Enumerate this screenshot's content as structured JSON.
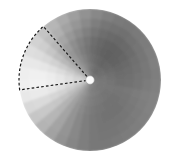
{
  "figure": {
    "name": "polar-grayscale-disk",
    "background_color": "#ffffff",
    "width": 175,
    "height": 164
  },
  "chart_data": {
    "type": "heatmap",
    "subtype": "polar-sector-heatmap",
    "title": "",
    "subtitle": "",
    "xlabel": "",
    "ylabel": "",
    "grid": false,
    "legend": null,
    "colormap": "grayscale",
    "colormap_range": [
      "#6b6b6b",
      "#f2f2f2"
    ],
    "center": {
      "cx": 90,
      "cy": 80,
      "label": "origin-marker"
    },
    "radius": 71,
    "inner_radius": 0,
    "n_angular_bins": 36,
    "n_radial_bins": 8,
    "angle_start_deg": 0,
    "angle_step_deg": 10,
    "radial_edges": [
      0,
      8.875,
      17.75,
      26.625,
      35.5,
      44.375,
      53.25,
      62.125,
      71
    ],
    "value_range": [
      64,
      245
    ],
    "note": "values are 0-255 gray levels per (angular bin, radial bin) cell, angular bin 0 starts at 0deg measured counterclockwise from east",
    "values": [
      [
        120,
        118,
        114,
        110,
        112,
        116,
        120,
        126
      ],
      [
        118,
        116,
        112,
        108,
        110,
        114,
        120,
        128
      ],
      [
        116,
        112,
        108,
        104,
        106,
        112,
        118,
        126
      ],
      [
        114,
        110,
        104,
        100,
        102,
        108,
        116,
        124
      ],
      [
        112,
        108,
        102,
        98,
        100,
        106,
        114,
        122
      ],
      [
        110,
        106,
        100,
        96,
        98,
        104,
        112,
        120
      ],
      [
        112,
        108,
        102,
        98,
        100,
        106,
        114,
        122
      ],
      [
        116,
        112,
        106,
        102,
        104,
        110,
        118,
        128
      ],
      [
        122,
        118,
        112,
        108,
        110,
        118,
        126,
        136
      ],
      [
        130,
        126,
        120,
        116,
        120,
        128,
        138,
        146
      ],
      [
        138,
        134,
        130,
        126,
        130,
        140,
        150,
        158
      ],
      [
        146,
        144,
        140,
        138,
        142,
        152,
        162,
        170
      ],
      [
        156,
        154,
        152,
        150,
        156,
        166,
        176,
        182
      ],
      [
        166,
        166,
        166,
        166,
        172,
        182,
        190,
        196
      ],
      [
        176,
        178,
        180,
        184,
        190,
        198,
        206,
        210
      ],
      [
        186,
        192,
        198,
        204,
        210,
        216,
        220,
        222
      ],
      [
        196,
        204,
        212,
        220,
        226,
        230,
        232,
        232
      ],
      [
        202,
        212,
        222,
        230,
        236,
        240,
        240,
        238
      ],
      [
        204,
        214,
        224,
        232,
        238,
        242,
        242,
        240
      ],
      [
        200,
        208,
        216,
        224,
        230,
        234,
        234,
        232
      ],
      [
        192,
        198,
        204,
        210,
        214,
        218,
        218,
        216
      ],
      [
        182,
        186,
        190,
        194,
        198,
        200,
        200,
        198
      ],
      [
        172,
        174,
        176,
        178,
        180,
        182,
        182,
        180
      ],
      [
        162,
        162,
        162,
        162,
        164,
        164,
        164,
        162
      ],
      [
        154,
        152,
        150,
        148,
        148,
        148,
        148,
        146
      ],
      [
        146,
        144,
        140,
        138,
        136,
        136,
        136,
        134
      ],
      [
        140,
        136,
        132,
        128,
        126,
        126,
        126,
        126
      ],
      [
        134,
        130,
        126,
        122,
        120,
        120,
        120,
        120
      ],
      [
        130,
        126,
        122,
        118,
        116,
        116,
        118,
        120
      ],
      [
        128,
        124,
        120,
        116,
        114,
        116,
        118,
        122
      ],
      [
        126,
        122,
        118,
        114,
        114,
        116,
        120,
        124
      ],
      [
        124,
        120,
        116,
        114,
        114,
        118,
        122,
        126
      ],
      [
        122,
        120,
        116,
        114,
        116,
        120,
        124,
        128
      ],
      [
        122,
        120,
        118,
        116,
        118,
        122,
        126,
        130
      ],
      [
        122,
        120,
        118,
        118,
        120,
        124,
        128,
        130
      ],
      [
        121,
        119,
        116,
        112,
        114,
        118,
        124,
        128
      ]
    ]
  },
  "annotation": {
    "name": "dashed-sector-overlay",
    "shape": "wedge",
    "stroke_color": "#1a1a1a",
    "stroke_width": 1.2,
    "dash_pattern": "2.6 2.2",
    "fill": "none",
    "apex": {
      "x": 90,
      "y": 80
    },
    "radius": 71,
    "start_angle_deg": 131,
    "end_angle_deg": 188,
    "start_point": {
      "x": 43,
      "y": 27
    },
    "end_point": {
      "x": 19,
      "y": 70
    }
  },
  "center_marker": {
    "name": "origin-dot",
    "cx": 90,
    "cy": 80,
    "r": 4.3,
    "fill": "#fcfcfc",
    "stroke": "#9a9a9a",
    "stroke_width": 0.6
  }
}
